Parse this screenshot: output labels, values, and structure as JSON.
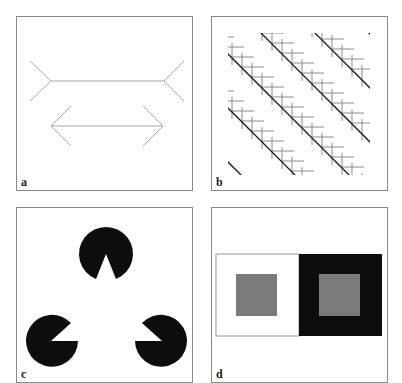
{
  "figure": {
    "panels": [
      {
        "id": "a",
        "label": "a",
        "description": "Müller-Lyer illusion"
      },
      {
        "id": "b",
        "label": "b",
        "description": "Zöllner illusion"
      },
      {
        "id": "c",
        "label": "c",
        "description": "Kanizsa triangle"
      },
      {
        "id": "d",
        "label": "d",
        "description": "Simultaneous brightness contrast"
      }
    ],
    "colors": {
      "border": "#8a8a8a",
      "line_light": "#a8a8a8",
      "line_dark": "#1a1a1a",
      "hatch": "#8c8c8c",
      "black": "#0d0d0d",
      "grey_square": "#7a7a7a",
      "white": "#ffffff"
    }
  }
}
